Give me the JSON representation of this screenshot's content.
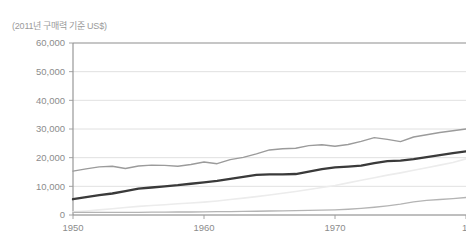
{
  "header": {
    "unit_note": "(2011년 구매력 기준 US$)"
  },
  "axis": {
    "y_ticks": [
      "60,000",
      "50,000",
      "40,000",
      "30,000",
      "20,000",
      "10,000",
      "0"
    ],
    "x_ticks": [
      "1950",
      "1960",
      "1970",
      "1"
    ]
  },
  "colors": {
    "grid": "#d8d8d8",
    "axis": "#8e8e8e",
    "tick_text": "#8c8c8c",
    "note_text": "#9a9a9a",
    "series_upper": "#9b9b9b",
    "series_main": "#3a3a3a",
    "series_faint": "#ececec",
    "series_lower": "#b4b4b4",
    "background": "#ffffff"
  },
  "chart_data": {
    "type": "line",
    "title": "",
    "subtitle": "",
    "xlabel": "",
    "ylabel": "(2011년 구매력 기준 US$)",
    "xlim": [
      1950,
      1980
    ],
    "ylim": [
      0,
      60000
    ],
    "xtick_values": [
      1950,
      1960,
      1970,
      1980
    ],
    "xtick_labels": [
      "1950",
      "1960",
      "1970",
      "1"
    ],
    "ytick_values": [
      0,
      10000,
      20000,
      30000,
      40000,
      50000,
      60000
    ],
    "ytick_labels": [
      "0",
      "10,000",
      "20,000",
      "30,000",
      "40,000",
      "50,000",
      "60,000"
    ],
    "grid": "horizontal",
    "legend": "none",
    "note": "Right edge is cropped; the final x tick label '1980' is cut to '1'.",
    "x": [
      1950,
      1951,
      1952,
      1953,
      1954,
      1955,
      1956,
      1957,
      1958,
      1959,
      1960,
      1961,
      1962,
      1963,
      1964,
      1965,
      1966,
      1967,
      1968,
      1969,
      1970,
      1971,
      1972,
      1973,
      1974,
      1975,
      1976,
      1977,
      1978,
      1979,
      1980
    ],
    "series": [
      {
        "name": "upper-gray-line",
        "color": "#9b9b9b",
        "width": 1.4,
        "values": [
          15300,
          16100,
          16800,
          17000,
          16200,
          17100,
          17400,
          17300,
          17000,
          17600,
          18500,
          17900,
          19300,
          20100,
          21300,
          22700,
          23100,
          23300,
          24200,
          24500,
          24000,
          24600,
          25700,
          27000,
          26400,
          25600,
          27200,
          28000,
          28800,
          29400,
          30000
        ]
      },
      {
        "name": "main-dark-line",
        "color": "#3a3a3a",
        "width": 2.3,
        "values": [
          5500,
          6200,
          6900,
          7500,
          8300,
          9200,
          9600,
          10000,
          10400,
          10900,
          11400,
          11900,
          12600,
          13300,
          14000,
          14200,
          14200,
          14300,
          15100,
          16000,
          16600,
          16900,
          17200,
          18100,
          18800,
          19000,
          19500,
          20200,
          20900,
          21600,
          22200
        ]
      },
      {
        "name": "faint-light-line",
        "color": "#ececec",
        "width": 1.6,
        "values": [
          1100,
          1400,
          1800,
          2200,
          2600,
          3000,
          3300,
          3600,
          3900,
          4200,
          4500,
          4900,
          5400,
          5900,
          6400,
          7000,
          7600,
          8200,
          8900,
          9600,
          10300,
          11200,
          12100,
          13000,
          13900,
          14700,
          15600,
          16500,
          17400,
          18300,
          19600
        ]
      },
      {
        "name": "lower-gray-line",
        "color": "#b4b4b4",
        "width": 1.3,
        "values": [
          900,
          900,
          900,
          900,
          950,
          950,
          1000,
          1000,
          1050,
          1050,
          1100,
          1150,
          1200,
          1250,
          1300,
          1400,
          1450,
          1500,
          1600,
          1700,
          1800,
          2000,
          2300,
          2700,
          3200,
          3800,
          4600,
          5100,
          5400,
          5700,
          6100
        ]
      }
    ]
  }
}
